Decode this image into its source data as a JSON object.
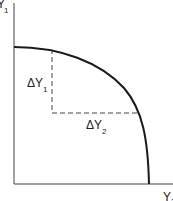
{
  "diagram": {
    "type": "production-possibility-frontier",
    "y_axis_label": {
      "main": "Y",
      "sub": "1"
    },
    "x_axis_label": {
      "main": "Y",
      "sub": "2"
    },
    "delta_y1_label": {
      "main": "ΔY",
      "sub": "1"
    },
    "delta_y2_label": {
      "main": "ΔY",
      "sub": "2"
    },
    "colors": {
      "ink": "#222222",
      "background": "#ffffff"
    }
  }
}
